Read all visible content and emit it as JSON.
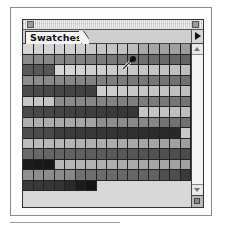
{
  "panel": {
    "tab_label": "Swatches",
    "icons": {
      "close": "close-box-icon",
      "zoom": "zoom-box-icon",
      "flyout": "flyout-menu-arrow-icon",
      "scroll_up": "scroll-up-arrow-icon",
      "scroll_down": "scroll-down-arrow-icon",
      "resize": "resize-grip-icon",
      "cursor": "eyedropper-icon"
    }
  },
  "grid": {
    "columns": 16,
    "rows": [
      [
        "#d6d6d6",
        "#d2d2d2",
        "#d2d2d2",
        "#d0d0d0",
        "#cfcfcf",
        "#cccccc",
        "#c9c9c9",
        "#c6c6c6",
        "#c4c4c4",
        "#c2c2c2",
        "#bdbdbd",
        "#a8a8a8",
        "#a5a5a5",
        "#a2a2a2",
        "#9f9f9f",
        "#9c9c9c"
      ],
      [
        "#8c8c8c",
        "#8a8a8a",
        "#888888",
        "#868686",
        "#848484",
        "#828282",
        "#808080",
        "#7c7c7c",
        "#787878",
        "#757575",
        "#727272",
        "#6f6f6f",
        "#6c6c6c",
        "#696969",
        "#666666",
        "#636363"
      ],
      [
        "#5a5a5a",
        "#585858",
        "#565656",
        "#d6d6d6",
        "#d4d4d4",
        "#d2d2d2",
        "#d0d0d0",
        "#cecece",
        "#cccccc",
        "#cacaca",
        "#c8c8c8",
        "#c6c6c6",
        "#c4c4c4",
        "#c2c2c2",
        "#c0c0c0",
        "#bebebe"
      ],
      [
        "#8e8e8e",
        "#8c8c8c",
        "#8a8a8a",
        "#888888",
        "#868686",
        "#848484",
        "#828282",
        "#808080",
        "#7e7e7e",
        "#7c7c7c",
        "#7a7a7a",
        "#787878",
        "#767676",
        "#747474",
        "#727272",
        "#707070"
      ],
      [
        "#4c4c4c",
        "#4a4a4a",
        "#484848",
        "#464646",
        "#444444",
        "#424242",
        "#404040",
        "#cecece",
        "#cccccc",
        "#cacaca",
        "#c8c8c8",
        "#c6c6c6",
        "#c4c4c4",
        "#c2c2c2",
        "#c0c0c0",
        "#bebebe"
      ],
      [
        "#c8c8c8",
        "#c6c6c6",
        "#c4c4c4",
        "#8c8c8c",
        "#8a8a8a",
        "#888888",
        "#868686",
        "#848484",
        "#828282",
        "#808080",
        "#7e7e7e",
        "#7c7c7c",
        "#7a7a7a",
        "#787878",
        "#767676",
        "#747474"
      ],
      [
        "#4a4a4a",
        "#484848",
        "#464646",
        "#444444",
        "#424242",
        "#404040",
        "#3e3e3e",
        "#3c3c3c",
        "#3a3a3a",
        "#383838",
        "#363636",
        "#c6c6c6",
        "#c4c4c4",
        "#c2c2c2",
        "#c0c0c0",
        "#bebebe"
      ],
      [
        "#b0b0b0",
        "#aeaeae",
        "#acacac",
        "#aaaaaa",
        "#a8a8a8",
        "#a6a6a6",
        "#a4a4a4",
        "#909090",
        "#8e8e8e",
        "#8c8c8c",
        "#8a8a8a",
        "#888888",
        "#868686",
        "#747474",
        "#727272",
        "#707070"
      ],
      [
        "#4e4e4e",
        "#4c4c4c",
        "#4a4a4a",
        "#3e3e3e",
        "#3c3c3c",
        "#3a3a3a",
        "#383838",
        "#363636",
        "#343434",
        "#323232",
        "#303030",
        "#2e2e2e",
        "#2c2c2c",
        "#2a2a2a",
        "#282828",
        "#c8c8c8"
      ],
      [
        "#bcbcbc",
        "#bababa",
        "#b8b8b8",
        "#b6b6b6",
        "#b4b4b4",
        "#b2b2b2",
        "#b0b0b0",
        "#aeaeae",
        "#acacac",
        "#aaaaaa",
        "#a8a8a8",
        "#a6a6a6",
        "#a4a4a4",
        "#a2a2a2",
        "#a0a0a0",
        "#9e9e9e"
      ],
      [
        "#6a6a6a",
        "#686868",
        "#666666",
        "#646464",
        "#626262",
        "#606060",
        "#5e5e5e",
        "#5c5c5c",
        "#5a5a5a",
        "#585858",
        "#565656",
        "#545454",
        "#525252",
        "#505050",
        "#4e4e4e",
        "#4c4c4c"
      ],
      [
        "#1a1a1a",
        "#181818",
        "#161616",
        "#b8b8b8",
        "#b6b6b6",
        "#b4b4b4",
        "#b2b2b2",
        "#b0b0b0",
        "#aeaeae",
        "#acacac",
        "#aaaaaa",
        "#a8a8a8",
        "#a6a6a6",
        "#a4a4a4",
        "#a2a2a2",
        "#a0a0a0"
      ],
      [
        "#909090",
        "#8e8e8e",
        "#8c8c8c",
        "#8a8a8a",
        "#888888",
        "#707070",
        "#6e6e6e",
        "#6c6c6c",
        "#6a6a6a",
        "#686868",
        "#666666",
        "#646464",
        "#626262",
        "#505050",
        "#4e4e4e",
        "#3a3a3a"
      ],
      [
        "#3a3a3a",
        "#383838",
        "#363636",
        "#343434",
        "#2a2a2a",
        "#1c1c1c",
        "#141414"
      ]
    ]
  }
}
